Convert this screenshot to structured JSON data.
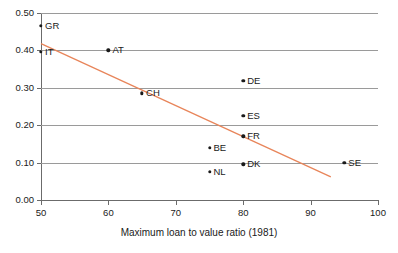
{
  "chart_data": {
    "type": "scatter",
    "title": "",
    "xlabel": "Maximum loan to value ratio (1981)",
    "ylabel": "",
    "xlim": [
      50,
      100
    ],
    "ylim": [
      0.0,
      0.5
    ],
    "xticks": [
      "50",
      "60",
      "70",
      "80",
      "90",
      "100"
    ],
    "xtick_values": [
      50,
      60,
      70,
      80,
      90,
      100
    ],
    "yticks": [
      "0.00",
      "0.10",
      "0.20",
      "0.30",
      "0.40",
      "0.50"
    ],
    "ytick_values": [
      0.0,
      0.1,
      0.2,
      0.3,
      0.4,
      0.5
    ],
    "grid": "horizontal",
    "legend": "none",
    "points": [
      {
        "label": "GR",
        "x": 50,
        "y": 0.465
      },
      {
        "label": "IT",
        "x": 50,
        "y": 0.397
      },
      {
        "label": "AT",
        "x": 60,
        "y": 0.4
      },
      {
        "label": "CH",
        "x": 65,
        "y": 0.285
      },
      {
        "label": "DE",
        "x": 80,
        "y": 0.318
      },
      {
        "label": "ES",
        "x": 80,
        "y": 0.225
      },
      {
        "label": "FR",
        "x": 80,
        "y": 0.17
      },
      {
        "label": "BE",
        "x": 75,
        "y": 0.14
      },
      {
        "label": "DK",
        "x": 80,
        "y": 0.095
      },
      {
        "label": "NL",
        "x": 75,
        "y": 0.075
      },
      {
        "label": "SE",
        "x": 95,
        "y": 0.1
      }
    ],
    "trendline": {
      "x_start": 50,
      "y_start": 0.418,
      "x_end": 93,
      "y_end": 0.062,
      "color": "#e8855a"
    },
    "colors": {
      "point": "#1a1a1a",
      "grid": "#9a9a9a",
      "axis": "#6b6b6b",
      "trend": "#e8855a",
      "background": "#ffffff"
    }
  }
}
